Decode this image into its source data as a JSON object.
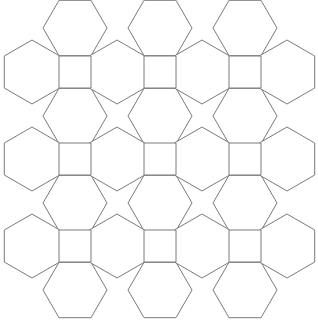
{
  "diagram": {
    "title": "",
    "stroke_color": "#7a7a7a",
    "fill_color": "#ffffff",
    "square_side": 32,
    "hex_circumradius": 32,
    "columns_x": [
      59,
      144,
      229
    ],
    "rows_y": [
      56,
      143,
      230
    ],
    "flat_hex_centers_y": [
      28,
      116,
      203,
      290
    ],
    "pointy_hex_centers_x": [
      32,
      117,
      202,
      287
    ]
  }
}
